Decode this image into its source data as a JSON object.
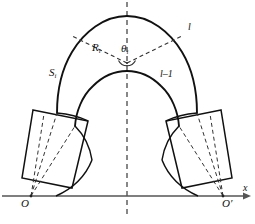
{
  "figure": {
    "background_color": "#ffffff",
    "stroke_color": "#111111",
    "dash_color": "#333333",
    "axis_color": "#444444"
  },
  "labels": {
    "radius": "R",
    "radius_sub": "i",
    "angle": "θ",
    "angle_sub": "i",
    "arc_length": "S",
    "arc_length_sub": "i",
    "segment_outer": "l",
    "segment_inner": "l–1",
    "origin_left": "O",
    "origin_right": "O′",
    "axis_x": "x"
  },
  "geometry": {
    "center_vertex": {
      "x": 127,
      "y": 63
    },
    "outer_radius": 62,
    "inner_radius": 40,
    "baseline_y": 196,
    "left_origin": {
      "x": 31,
      "y": 196
    },
    "right_origin": {
      "x": 223,
      "y": 196
    },
    "angle_marker_radius": 9,
    "symmetry_axis_x": 127
  },
  "elements": {
    "outer_arc": "outer arch curve",
    "inner_arc": "inner arch curve",
    "left_wedge": "left abutment block",
    "right_wedge": "right abutment block",
    "center_line": "vertical dashed symmetry axis",
    "x_axis": "horizontal ground axis with arrow"
  }
}
